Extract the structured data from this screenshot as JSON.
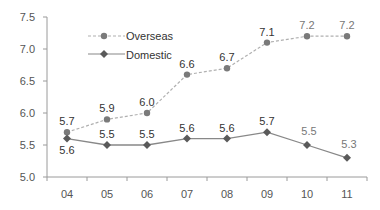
{
  "chart_data": {
    "type": "line",
    "title": "",
    "xlabel": "",
    "ylabel": "",
    "categories": [
      "04",
      "05",
      "06",
      "07",
      "08",
      "09",
      "10",
      "11"
    ],
    "ylim": [
      5.0,
      7.5
    ],
    "yticks": [
      "5.0",
      "5.5",
      "6.0",
      "6.5",
      "7.0",
      "7.5"
    ],
    "grid": false,
    "legend_position": "upper-left inside",
    "series": [
      {
        "name": "Overseas",
        "values": [
          5.7,
          5.9,
          6.0,
          6.6,
          6.7,
          7.1,
          7.2,
          7.2
        ],
        "labels": [
          "5.7",
          "5.9",
          "6.0",
          "6.6",
          "6.7",
          "7.1",
          "7.2",
          "7.2"
        ],
        "line_style": "dashed",
        "marker": "circle",
        "color": "#7a7a7a",
        "line_color": "#b0b0b0"
      },
      {
        "name": "Domestic",
        "values": [
          5.6,
          5.5,
          5.5,
          5.6,
          5.6,
          5.7,
          5.5,
          5.3
        ],
        "labels": [
          "5.6",
          "5.5",
          "5.5",
          "5.6",
          "5.6",
          "5.7",
          "5.5",
          "5.3"
        ],
        "line_style": "solid",
        "marker": "diamond",
        "color": "#5a5a5a",
        "line_color": "#888888"
      }
    ]
  },
  "legend": {
    "items": [
      {
        "label": "Overseas"
      },
      {
        "label": "Domestic"
      }
    ]
  }
}
